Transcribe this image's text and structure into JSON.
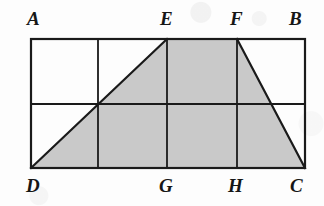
{
  "figure": {
    "kind": "geometry-diagram",
    "background_color": "#fdfdfd",
    "stroke_color": "#1a1a1a",
    "shade_color": "#c9c9c9",
    "outer_stroke_width": 2.2,
    "grid_stroke_width": 1.8,
    "diagonal_stroke_width": 2.2,
    "rect": {
      "x": 31,
      "y": 39,
      "width": 274,
      "height": 129
    },
    "grid": {
      "columns": 4,
      "rows": 2,
      "vertical_lines_x": [
        98,
        167,
        237
      ],
      "horizontal_lines_y": [
        104
      ]
    },
    "points": [
      {
        "id": "A",
        "label": "A",
        "x": 31,
        "y": 39,
        "label_x": 27,
        "label_y": 9,
        "position": "top-left"
      },
      {
        "id": "E",
        "label": "E",
        "x": 167,
        "y": 39,
        "label_x": 160,
        "label_y": 9,
        "position": "top"
      },
      {
        "id": "F",
        "label": "F",
        "x": 237,
        "y": 39,
        "label_x": 230,
        "label_y": 9,
        "position": "top"
      },
      {
        "id": "B",
        "label": "B",
        "x": 305,
        "y": 39,
        "label_x": 289,
        "label_y": 9,
        "position": "top-right"
      },
      {
        "id": "D",
        "label": "D",
        "x": 31,
        "y": 168,
        "label_x": 26,
        "label_y": 176,
        "position": "bottom-left"
      },
      {
        "id": "G",
        "label": "G",
        "x": 167,
        "y": 168,
        "label_x": 159,
        "label_y": 176,
        "position": "bottom"
      },
      {
        "id": "H",
        "label": "H",
        "x": 237,
        "y": 168,
        "label_x": 228,
        "label_y": 176,
        "position": "bottom"
      },
      {
        "id": "C",
        "label": "C",
        "x": 305,
        "y": 168,
        "label_x": 290,
        "label_y": 176,
        "position": "bottom-right"
      }
    ],
    "shaded_polygon": {
      "name": "DEFC",
      "vertices": [
        "D",
        "E",
        "F",
        "C"
      ],
      "path": "31,168 167,39 237,39 305,168",
      "fill": "#c9c9c9"
    },
    "drawn_segments": [
      {
        "name": "AB",
        "from": "A",
        "to": "B",
        "type": "outline"
      },
      {
        "name": "BC",
        "from": "B",
        "to": "C",
        "type": "outline"
      },
      {
        "name": "CD",
        "from": "C",
        "to": "D",
        "type": "outline"
      },
      {
        "name": "DA",
        "from": "D",
        "to": "A",
        "type": "outline"
      },
      {
        "name": "EG",
        "from": "E",
        "to": "G",
        "type": "grid-vertical"
      },
      {
        "name": "FH",
        "from": "F",
        "to": "H",
        "type": "grid-vertical"
      },
      {
        "name": "column-1-vertical",
        "from_x": 98,
        "from_y": 39,
        "to_x": 98,
        "to_y": 168,
        "type": "grid-vertical"
      },
      {
        "name": "midline-horizontal",
        "from_x": 31,
        "from_y": 104,
        "to_x": 305,
        "to_y": 104,
        "type": "grid-horizontal"
      },
      {
        "name": "DE",
        "from": "D",
        "to": "E",
        "type": "diagonal"
      },
      {
        "name": "FC",
        "from": "F",
        "to": "C",
        "type": "diagonal"
      }
    ]
  }
}
